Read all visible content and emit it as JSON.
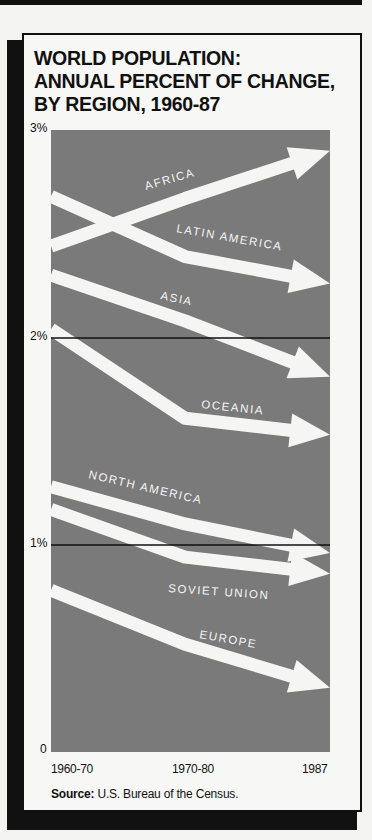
{
  "title": {
    "line1": "WORLD POPULATION:",
    "line2": "ANNUAL PERCENT OF CHANGE,",
    "line3": "BY REGION, 1960-87"
  },
  "y_axis": {
    "ticks": [
      "3%",
      "2%",
      "1%",
      "0"
    ]
  },
  "x_axis": {
    "ticks": [
      "1960-70",
      "1970-80",
      "1987"
    ]
  },
  "source": {
    "label": "Source:",
    "text": "U.S. Bureau of the Census."
  },
  "colors": {
    "plot_bg": "#7a7a7a",
    "arrow": "#f5f5f3",
    "frame": "#111111"
  },
  "chart_data": {
    "type": "line",
    "title": "WORLD POPULATION: ANNUAL PERCENT OF CHANGE, BY REGION, 1960-87",
    "xlabel": "",
    "ylabel": "Annual percent of change",
    "categories": [
      "1960-70",
      "1970-80",
      "1987"
    ],
    "ylim": [
      0,
      3
    ],
    "yticks": [
      "0",
      "1%",
      "2%",
      "3%"
    ],
    "gridlines": [
      1,
      2
    ],
    "legend": "inline labels on arrows",
    "series": [
      {
        "name": "AFRICA",
        "values": [
          2.44,
          2.67,
          2.9
        ]
      },
      {
        "name": "LATIN AMERICA",
        "values": [
          2.68,
          2.39,
          2.26
        ]
      },
      {
        "name": "ASIA",
        "values": [
          2.3,
          2.08,
          1.81
        ]
      },
      {
        "name": "OCEANIA",
        "values": [
          2.04,
          1.61,
          1.53
        ]
      },
      {
        "name": "NORTH AMERICA",
        "values": [
          1.28,
          1.1,
          0.96
        ]
      },
      {
        "name": "SOVIET UNION",
        "values": [
          1.17,
          0.94,
          0.86
        ]
      },
      {
        "name": "EUROPE",
        "values": [
          0.78,
          0.52,
          0.31
        ]
      }
    ],
    "source": "Source: U.S. Bureau of the Census."
  }
}
